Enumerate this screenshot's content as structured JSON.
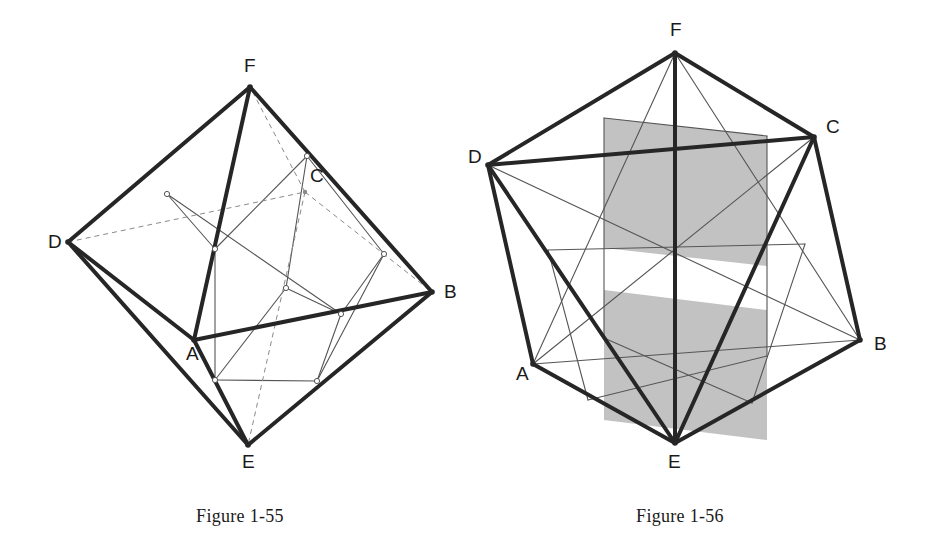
{
  "page": {
    "background_color": "#ffffff",
    "width": 925,
    "height": 549,
    "kind": "geometry-figure-plate"
  },
  "style": {
    "hull_color": "#262626",
    "hull_width": 4.0,
    "thin_color": "#555555",
    "thin_width": 1.1,
    "dashed_color": "#8a8a8a",
    "dashed_width": 1.0,
    "dash_pattern": "5,4",
    "shade_fill": "#c2c2c2",
    "node_stroke": "#555555",
    "node_fill": "#ffffff",
    "label_color": "#1a1a1a",
    "caption_color": "#1a1a1a"
  },
  "figures": [
    {
      "id": "figure-1-55",
      "caption": "Figure 1-55",
      "caption_pos": {
        "x": 240,
        "y": 522
      },
      "description": "Octahedron ABCDEF drawn in outline with an inscribed cube; hidden edges dashed, construction lines thin, small circular nodes at the cube vertices.",
      "vertices": [
        {
          "name": "A",
          "x": 194,
          "y": 340,
          "label_x": 186,
          "label_y": 360,
          "hidden": false
        },
        {
          "name": "B",
          "x": 432,
          "y": 292,
          "label_x": 444,
          "label_y": 298,
          "hidden": false
        },
        {
          "name": "C",
          "x": 305,
          "y": 192,
          "label_x": 310,
          "label_y": 182,
          "hidden": true
        },
        {
          "name": "D",
          "x": 68,
          "y": 242,
          "label_x": 48,
          "label_y": 248,
          "hidden": false
        },
        {
          "name": "E",
          "x": 248,
          "y": 445,
          "label_x": 242,
          "label_y": 468,
          "hidden": false
        },
        {
          "name": "F",
          "x": 250,
          "y": 87,
          "label_x": 244,
          "label_y": 72,
          "hidden": false
        }
      ],
      "hull_edges": [
        [
          "D",
          "F"
        ],
        [
          "F",
          "B"
        ],
        [
          "B",
          "E"
        ],
        [
          "E",
          "D"
        ],
        [
          "D",
          "A"
        ],
        [
          "A",
          "B"
        ],
        [
          "A",
          "F"
        ],
        [
          "A",
          "E"
        ]
      ],
      "dashed_edges": [
        [
          "D",
          "C"
        ],
        [
          "C",
          "B"
        ],
        [
          "C",
          "F"
        ],
        [
          "C",
          "E"
        ]
      ],
      "cube_nodes": [
        {
          "id": "n1",
          "x": 307,
          "y": 156
        },
        {
          "id": "n2",
          "x": 167,
          "y": 194
        },
        {
          "id": "n3",
          "x": 215,
          "y": 249
        },
        {
          "id": "n4",
          "x": 384,
          "y": 254
        },
        {
          "id": "n5",
          "x": 286,
          "y": 288
        },
        {
          "id": "n6",
          "x": 341,
          "y": 314
        },
        {
          "id": "n7",
          "x": 215,
          "y": 380
        },
        {
          "id": "n8",
          "x": 317,
          "y": 381
        }
      ],
      "cube_edges": [
        [
          "n1",
          "n3"
        ],
        [
          "n1",
          "n5"
        ],
        [
          "n2",
          "n3"
        ],
        [
          "n3",
          "n7"
        ],
        [
          "n4",
          "n6"
        ],
        [
          "n5",
          "n7"
        ],
        [
          "n5",
          "n6"
        ],
        [
          "n2",
          "n6"
        ],
        [
          "n1",
          "n4"
        ],
        [
          "n4",
          "n8"
        ],
        [
          "n7",
          "n8"
        ],
        [
          "n6",
          "n8"
        ]
      ]
    },
    {
      "id": "figure-1-56",
      "caption": "Figure 1-56",
      "caption_pos": {
        "x": 680,
        "y": 522
      },
      "description": "Octahedron ABCDEF seen along a 3-fold axis with an inscribed cube; two shaded parallelogram cross-sections are highlighted in grey.",
      "vertices": [
        {
          "name": "A",
          "x": 533,
          "y": 364,
          "label_x": 516,
          "label_y": 380,
          "hidden": false
        },
        {
          "name": "B",
          "x": 860,
          "y": 340,
          "label_x": 874,
          "label_y": 350,
          "hidden": false
        },
        {
          "name": "C",
          "x": 814,
          "y": 137,
          "label_x": 826,
          "label_y": 133,
          "hidden": false
        },
        {
          "name": "D",
          "x": 488,
          "y": 165,
          "label_x": 468,
          "label_y": 163,
          "hidden": false
        },
        {
          "name": "E",
          "x": 675,
          "y": 443,
          "label_x": 668,
          "label_y": 468,
          "hidden": false
        },
        {
          "name": "F",
          "x": 675,
          "y": 53,
          "label_x": 670,
          "label_y": 36,
          "hidden": false
        }
      ],
      "hull_edges": [
        [
          "D",
          "F"
        ],
        [
          "F",
          "C"
        ],
        [
          "C",
          "B"
        ],
        [
          "B",
          "E"
        ],
        [
          "E",
          "A"
        ],
        [
          "A",
          "D"
        ],
        [
          "D",
          "C"
        ],
        [
          "D",
          "E"
        ],
        [
          "F",
          "E"
        ],
        [
          "C",
          "E"
        ]
      ],
      "thin_edges": [
        [
          "F",
          "A"
        ],
        [
          "F",
          "B"
        ],
        [
          "A",
          "C"
        ],
        [
          "A",
          "B"
        ],
        [
          "D",
          "B"
        ]
      ],
      "cube_nodes": [
        {
          "id": "m1",
          "x": 604,
          "y": 118
        },
        {
          "id": "m2",
          "x": 767,
          "y": 136
        },
        {
          "id": "m3",
          "x": 548,
          "y": 250
        },
        {
          "id": "m4",
          "x": 604,
          "y": 248
        },
        {
          "id": "m5",
          "x": 767,
          "y": 266
        },
        {
          "id": "m6",
          "x": 805,
          "y": 244
        },
        {
          "id": "m7",
          "x": 604,
          "y": 338
        },
        {
          "id": "m8",
          "x": 767,
          "y": 356
        },
        {
          "id": "m9",
          "x": 588,
          "y": 400
        },
        {
          "id": "m10",
          "x": 752,
          "y": 403
        }
      ],
      "cube_edges": [
        [
          "m1",
          "m7"
        ],
        [
          "m2",
          "m8"
        ],
        [
          "m1",
          "m2"
        ],
        [
          "m3",
          "m6"
        ],
        [
          "m7",
          "m10"
        ],
        [
          "m9",
          "m8"
        ],
        [
          "m3",
          "m9"
        ],
        [
          "m6",
          "m10"
        ]
      ],
      "shaded_regions": [
        {
          "name": "upper-cross-section",
          "points": "604,118 767,136 767,266 604,248"
        },
        {
          "name": "lower-cross-section",
          "points": "604,290 767,310 767,440 604,420"
        }
      ]
    }
  ]
}
